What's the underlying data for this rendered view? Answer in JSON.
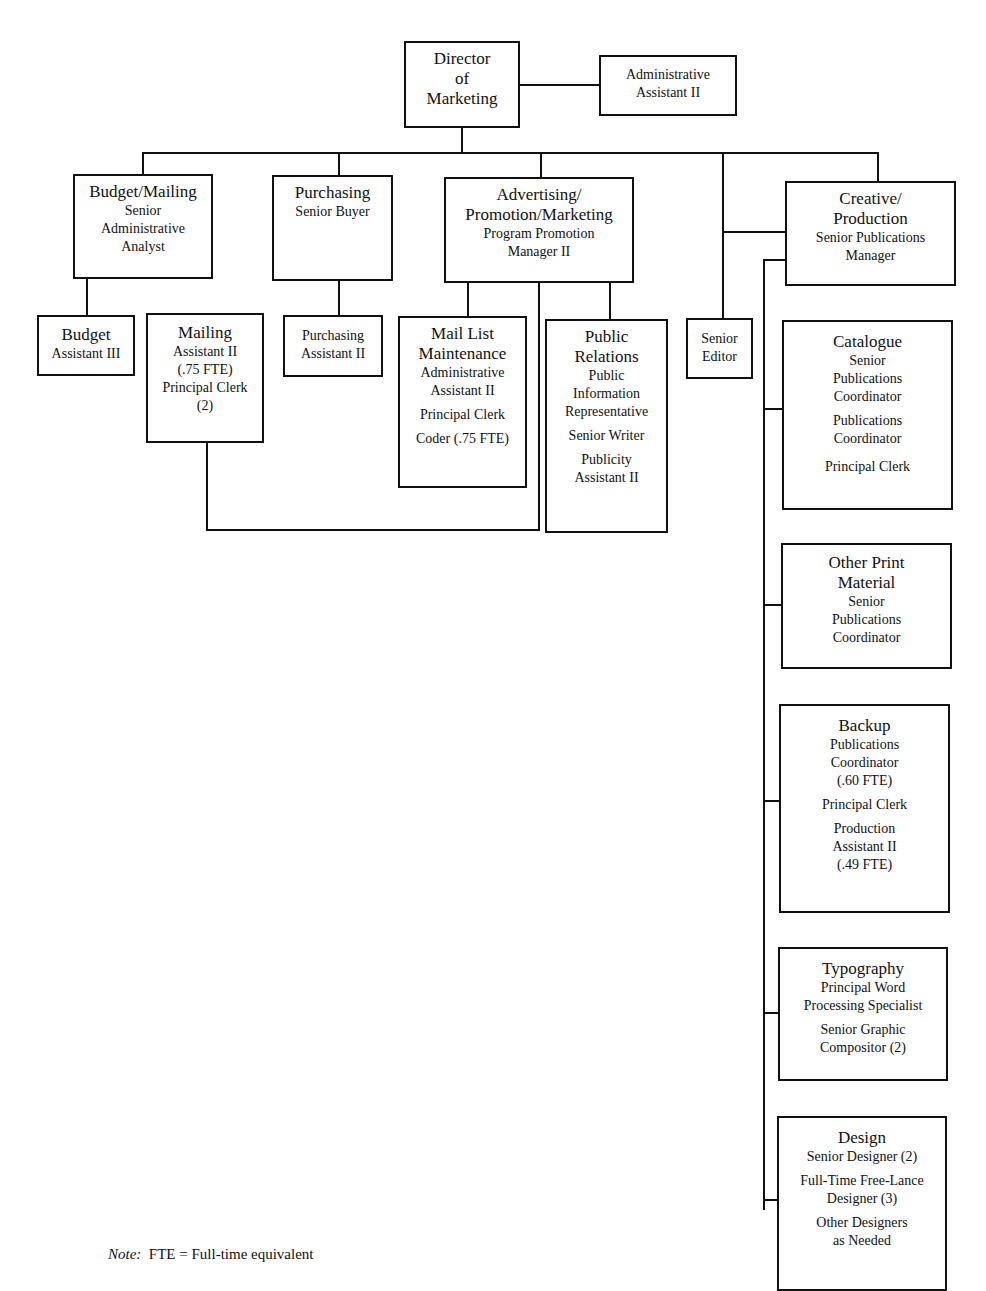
{
  "title_partial": "Figure: Department of Marketing, Organization Chart",
  "director": {
    "lines": [
      "Director",
      "of",
      "Marketing"
    ]
  },
  "admin_assistant": {
    "lines": [
      "Administrative",
      "Assistant II"
    ]
  },
  "units": {
    "budget_mailing": {
      "head": "Budget/Mailing",
      "lines": [
        "Senior",
        "Administrative",
        "Analyst"
      ]
    },
    "purchasing": {
      "head": "Purchasing",
      "lines": [
        "Senior Buyer"
      ]
    },
    "advertising": {
      "head1": "Advertising/",
      "head2": "Promotion/Marketing",
      "lines": [
        "Program Promotion",
        "Manager II"
      ]
    },
    "senior_editor": {
      "lines": [
        "Senior",
        "Editor"
      ]
    },
    "creative": {
      "head1": "Creative/",
      "head2": "Production",
      "lines": [
        "Senior Publications",
        "Manager"
      ]
    }
  },
  "subunits": {
    "budget": {
      "head": "Budget",
      "lines": [
        "Assistant III"
      ]
    },
    "mailing": {
      "head": "Mailing",
      "lines": [
        "Assistant II",
        "(.75 FTE)",
        "Principal Clerk",
        "(2)"
      ]
    },
    "purchasing_assistant": {
      "lines": [
        "Purchasing",
        "Assistant II"
      ]
    },
    "mail_list": {
      "head1": "Mail List",
      "head2": "Maintenance",
      "lines": [
        "Administrative",
        "Assistant II"
      ],
      "extra": [
        "Principal Clerk",
        "Coder (.75 FTE)"
      ]
    },
    "public_relations": {
      "head1": "Public",
      "head2": "Relations",
      "lines": [
        "Public",
        "Information",
        "Representative"
      ],
      "extra1": "Senior Writer",
      "extra2": [
        "Publicity",
        "Assistant II"
      ]
    },
    "catalogue": {
      "head": "Catalogue",
      "lines": [
        "Senior",
        "Publications",
        "Coordinator"
      ],
      "extra1": [
        "Publications",
        "Coordinator"
      ],
      "extra2": "Principal Clerk"
    },
    "other_print": {
      "head1": "Other Print",
      "head2": "Material",
      "lines": [
        "Senior",
        "Publications",
        "Coordinator"
      ]
    },
    "backup": {
      "head": "Backup",
      "lines": [
        "Publications",
        "Coordinator",
        "(.60 FTE)"
      ],
      "extra1": "Principal Clerk",
      "extra2": [
        "Production",
        "Assistant II",
        "(.49 FTE)"
      ]
    },
    "typography": {
      "head": "Typography",
      "lines": [
        "Principal Word",
        "Processing Specialist"
      ],
      "extra": [
        "Senior Graphic",
        "Compositor (2)"
      ]
    },
    "design": {
      "head": "Design",
      "lines": [
        "Senior Designer (2)"
      ],
      "extra1": [
        "Full-Time Free-Lance",
        "Designer (3)"
      ],
      "extra2": [
        "Other Designers",
        "as Needed"
      ]
    }
  },
  "note": {
    "label": "Note:",
    "text": "FTE = Full-time equivalent"
  }
}
